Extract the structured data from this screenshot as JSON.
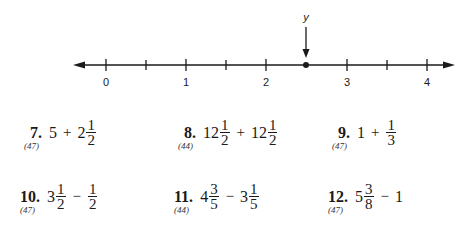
{
  "number_line": {
    "tick_labels": [
      "0",
      "1",
      "2",
      "3",
      "4"
    ],
    "point_label": "y",
    "point_value": 2.5
  },
  "problems": [
    {
      "number": "7.",
      "ref": "(47)",
      "a_whole": "5",
      "op": "+",
      "b_whole": "2",
      "b_num": "1",
      "b_den": "2"
    },
    {
      "number": "8.",
      "ref": "(44)",
      "a_whole": "12",
      "a_num": "1",
      "a_den": "2",
      "op": "+",
      "b_whole": "12",
      "b_num": "1",
      "b_den": "2"
    },
    {
      "number": "9.",
      "ref": "(47)",
      "a_whole": "1",
      "op": "+",
      "b_num": "1",
      "b_den": "3"
    },
    {
      "number": "10.",
      "ref": "(47)",
      "a_whole": "3",
      "a_num": "1",
      "a_den": "2",
      "op": "−",
      "b_num": "1",
      "b_den": "2"
    },
    {
      "number": "11.",
      "ref": "(44)",
      "a_whole": "4",
      "a_num": "3",
      "a_den": "5",
      "op": "−",
      "b_whole": "3",
      "b_num": "1",
      "b_den": "5"
    },
    {
      "number": "12.",
      "ref": "(47)",
      "a_whole": "5",
      "a_num": "3",
      "a_den": "8",
      "op": "−",
      "b_whole": "1"
    }
  ]
}
